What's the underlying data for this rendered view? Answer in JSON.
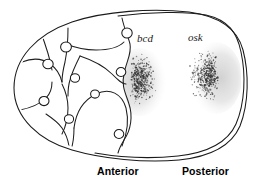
{
  "figure": {
    "background_color": "#ffffff",
    "ink_color": "#1a1a1a",
    "stipple_color": "#3a3a3a",
    "shade_color": "#d9d9d9"
  },
  "gene_labels": [
    {
      "id": "bcd",
      "text": "bcd",
      "x": 137,
      "y": 42,
      "style": "italic"
    },
    {
      "id": "osk",
      "text": "osk",
      "x": 188,
      "y": 41,
      "style": "italic"
    }
  ],
  "axis_labels": [
    {
      "id": "anterior",
      "text": "Anterior",
      "x": 97,
      "y": 175
    },
    {
      "id": "posterior",
      "text": "Posterior",
      "x": 182,
      "y": 175
    }
  ],
  "structures": {
    "follicle_epithelium": "double-outline-egg-chamber",
    "oocyte": "posterior-compartment",
    "nurse_cells": 7,
    "ring_canals": 9
  },
  "localization_domains": [
    {
      "id": "bcd-domain",
      "gene": "bcd",
      "pole": "anterior",
      "description": "bicoid mRNA concentrated at the anterior cortex of the oocyte",
      "center_x": 136,
      "center_y": 80,
      "particle_count": 430
    },
    {
      "id": "osk-domain",
      "gene": "osk",
      "pole": "posterior",
      "description": "oskar mRNA concentrated at the posterior pole of the oocyte",
      "center_x": 214,
      "center_y": 76,
      "particle_count": 430
    }
  ],
  "icons": {
    "ring_canal": "ring-canal-icon",
    "stipple": "mrna-particle-icon"
  }
}
